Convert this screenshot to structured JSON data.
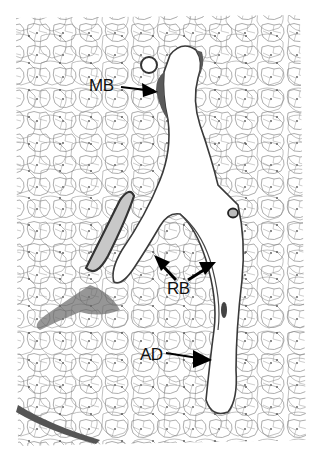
{
  "figure": {
    "type": "histology-micrograph",
    "colors": {
      "background": "#ffffff",
      "tissue_line": "#7a7a7a",
      "wall_dark": "#3a3a3a",
      "label": "#111111"
    }
  },
  "labels": [
    {
      "id": "mb",
      "text": "MB",
      "x": 89,
      "y": 77
    },
    {
      "id": "rb",
      "text": "RB",
      "x": 167,
      "y": 280
    },
    {
      "id": "ad",
      "text": "AD",
      "x": 140,
      "y": 346
    }
  ]
}
